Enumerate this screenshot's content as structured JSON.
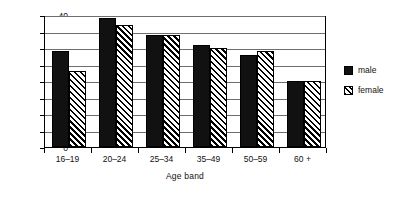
{
  "chart_data": {
    "type": "bar",
    "title": "",
    "subtitle": "",
    "xlabel": "Age band",
    "ylabel": "Per cent",
    "categories": [
      "16–19",
      "20–24",
      "25–34",
      "35–49",
      "50–59",
      "60 +"
    ],
    "series": [
      {
        "name": "male",
        "values": [
          29,
          39,
          34,
          31,
          28,
          20
        ],
        "color": "#111111",
        "fill": "solid"
      },
      {
        "name": "female",
        "values": [
          23,
          37,
          34,
          30,
          29,
          20
        ],
        "color": "#111111",
        "fill": "diagonal-hatch"
      }
    ],
    "ylim": [
      0,
      40
    ],
    "yticks": [
      0,
      5,
      10,
      15,
      20,
      25,
      30,
      35,
      40
    ],
    "ytick_labels": [
      "0",
      "5",
      "10",
      "15",
      "20",
      "25",
      "30",
      "35",
      "40"
    ],
    "grid": "horizontal",
    "legend_position": "right",
    "legend_entries": [
      "male",
      "female"
    ]
  }
}
